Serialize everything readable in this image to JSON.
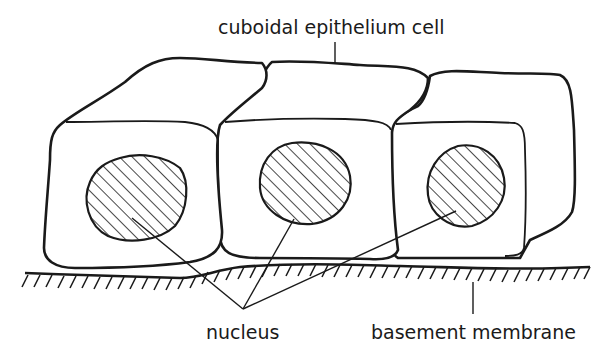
{
  "diagram": {
    "title": "Cuboidal epithelium",
    "labels": {
      "cell": "cuboidal epithelium cell",
      "nucleus": "nucleus",
      "membrane": "basement membrane"
    },
    "components": [
      {
        "name": "cell-left",
        "has_nucleus": true
      },
      {
        "name": "cell-middle",
        "has_nucleus": true
      },
      {
        "name": "cell-right",
        "has_nucleus": true
      },
      {
        "name": "basement-membrane",
        "style": "hatched ground line"
      }
    ],
    "colors": {
      "line": "#1a1a1a",
      "background": "#ffffff"
    }
  }
}
